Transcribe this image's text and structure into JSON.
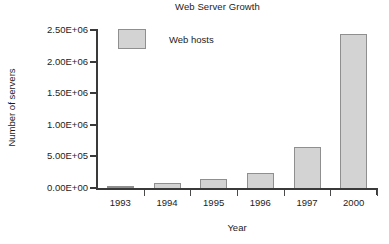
{
  "chart_data": {
    "type": "bar",
    "title": "Web Server Growth",
    "xlabel": "Year",
    "ylabel": "Number of servers",
    "categories": [
      "1993",
      "1994",
      "1995",
      "1996",
      "1997",
      "2000"
    ],
    "values": [
      30000,
      80000,
      145000,
      240000,
      645000,
      2440000
    ],
    "series": [
      {
        "name": "Web hosts",
        "values": [
          30000,
          80000,
          145000,
          240000,
          645000,
          2440000
        ]
      }
    ],
    "ylim": [
      0,
      2500000
    ],
    "ytick_values": [
      0,
      500000,
      1000000,
      1500000,
      2000000,
      2500000
    ],
    "ytick_labels": [
      "0.00E+00",
      "5.00E+05",
      "1.00E+06",
      "1.50E+06",
      "2.00E+06",
      "2.50E+06"
    ],
    "grid": false,
    "legend_position": "top-left-inside",
    "legend_entries": [
      "Web hosts"
    ],
    "bar_color": "#d3d3d3",
    "bar_border_color": "#8f8f8f",
    "axis_color": "#3a3a3a",
    "background_color": "#ffffff"
  },
  "legend": {
    "entries": [
      {
        "label": "Web hosts",
        "swatch_name": "legend-swatch-web-hosts"
      }
    ]
  },
  "axes": {
    "y": {
      "label": "Number of servers",
      "ticks": [
        {
          "label": "2.50E+06",
          "value": 2500000
        },
        {
          "label": "2.00E+06",
          "value": 2000000
        },
        {
          "label": "1.50E+06",
          "value": 1500000
        },
        {
          "label": "1.00E+06",
          "value": 1000000
        },
        {
          "label": "5.00E+05",
          "value": 500000
        },
        {
          "label": "0.00E+00",
          "value": 0
        }
      ]
    },
    "x": {
      "label": "Year",
      "ticks": [
        {
          "label": "1993"
        },
        {
          "label": "1994"
        },
        {
          "label": "1995"
        },
        {
          "label": "1996"
        },
        {
          "label": "1997"
        },
        {
          "label": "2000"
        }
      ]
    }
  }
}
